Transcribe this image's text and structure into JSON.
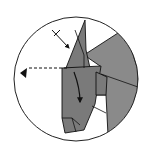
{
  "canvas": {
    "width": 147,
    "height": 157,
    "background": "#ffffff"
  },
  "colors": {
    "paper_gray": "#7a7a7a",
    "paper_gray_light": "#8a8a8a",
    "line": "#111111",
    "circle_stroke": "#222222"
  },
  "diagram": {
    "type": "origami-step-detail",
    "frame": {
      "shape": "circle",
      "cx": 76,
      "cy": 79,
      "r": 62
    },
    "symbols": [
      {
        "name": "view-eye-symbol",
        "points": "20,73 27,68 26,78"
      },
      {
        "name": "hidden-line-dashed",
        "x1": 29,
        "y1": 68,
        "x2": 67,
        "y2": 68
      },
      {
        "name": "push-arrow",
        "x1": 52,
        "y1": 30,
        "x2": 69,
        "y2": 48
      },
      {
        "name": "fold-arrow-curved",
        "d": "M74,72 Q80,88 80,102"
      }
    ],
    "layers": [
      {
        "name": "back-right-flap",
        "points": "84,55 118,33 130,45 138,70 138,100 128,122 108,135 106,95 96,95 96,72 100,66"
      },
      {
        "name": "tall-point",
        "points": "66,68 85,20 86,50 90,68"
      },
      {
        "name": "front-column",
        "points": "62,68 101,66 95,104 84,130 65,133 62,118"
      },
      {
        "name": "middle-flap",
        "points": "96,72 107,77 106,95 96,95"
      }
    ],
    "creases": [
      {
        "x1": 75,
        "y1": 30,
        "x2": 84,
        "y2": 55
      },
      {
        "x1": 84,
        "y1": 55,
        "x2": 84,
        "y2": 68
      },
      {
        "x1": 101,
        "y1": 74,
        "x2": 138,
        "y2": 87
      },
      {
        "x1": 92,
        "y1": 106,
        "x2": 106,
        "y2": 113
      },
      {
        "x1": 62,
        "y1": 118,
        "x2": 72,
        "y2": 118
      },
      {
        "x1": 72,
        "y1": 118,
        "x2": 76,
        "y2": 132
      },
      {
        "x1": 72,
        "y1": 118,
        "x2": 80,
        "y2": 125
      }
    ]
  }
}
